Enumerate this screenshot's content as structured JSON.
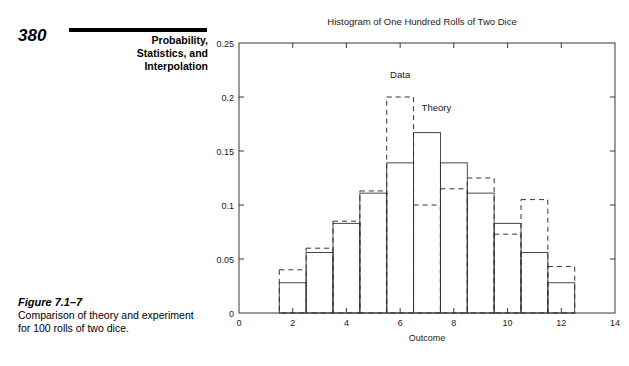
{
  "page": {
    "number": "380",
    "chapter_title_lines": [
      "Probability,",
      "Statistics, and",
      "Interpolation"
    ]
  },
  "figure": {
    "label": "Figure 7.1–7",
    "caption": "Comparison of theory and experiment for 100 rolls of two dice."
  },
  "chart_data": {
    "type": "bar",
    "title": "Histogram of One Hundred Rolls of Two Dice",
    "xlabel": "Outcome",
    "ylabel": "Relative Frequency",
    "xlim": [
      0,
      14
    ],
    "ylim": [
      0,
      0.25
    ],
    "xticks": [
      0,
      2,
      4,
      6,
      8,
      10,
      12,
      14
    ],
    "xtick_labels": [
      "0",
      "2",
      "4",
      "6",
      "8",
      "10",
      "12",
      "14"
    ],
    "yticks": [
      0,
      0.05,
      0.1,
      0.15,
      0.2,
      0.25
    ],
    "ytick_labels": [
      "0",
      "0.05",
      "0.1",
      "0.15",
      "0.2",
      "0.25"
    ],
    "grid": false,
    "legend_position": "inline-annotations",
    "categories": [
      2,
      3,
      4,
      5,
      6,
      7,
      8,
      9,
      10,
      11,
      12
    ],
    "series": [
      {
        "name": "Theory",
        "style": "solid",
        "values": [
          0.028,
          0.056,
          0.083,
          0.111,
          0.139,
          0.167,
          0.139,
          0.111,
          0.083,
          0.056,
          0.028
        ]
      },
      {
        "name": "Data",
        "style": "dashed",
        "values": [
          0.04,
          0.06,
          0.085,
          0.113,
          0.2,
          0.1,
          0.115,
          0.125,
          0.073,
          0.105,
          0.043
        ]
      }
    ],
    "annotations": [
      {
        "text": "Data",
        "x": 6,
        "y": 0.218
      },
      {
        "text": "Theory",
        "x": 7.35,
        "y": 0.187
      }
    ]
  }
}
